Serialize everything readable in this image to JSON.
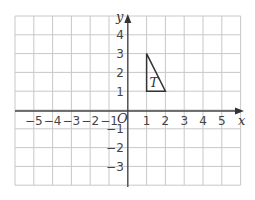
{
  "diagram": {
    "type": "coordinate-grid",
    "x_axis_label": "x",
    "y_axis_label": "y",
    "origin_label": "O",
    "x_range": [
      -6,
      6
    ],
    "y_range": [
      -4,
      5
    ],
    "x_ticks": [
      "−5",
      "−4",
      "−3",
      "−2",
      "−1",
      "1",
      "2",
      "3",
      "4",
      "5"
    ],
    "y_ticks_positive": [
      "1",
      "2",
      "3",
      "4"
    ],
    "y_ticks_negative": [
      "−1",
      "−2",
      "−3"
    ],
    "shape": {
      "label": "T",
      "vertices": [
        [
          1,
          1
        ],
        [
          1,
          3
        ],
        [
          2,
          1
        ]
      ]
    },
    "colors": {
      "grid": "#c8c8c8",
      "axis": "#444444",
      "shape": "#333333"
    }
  }
}
